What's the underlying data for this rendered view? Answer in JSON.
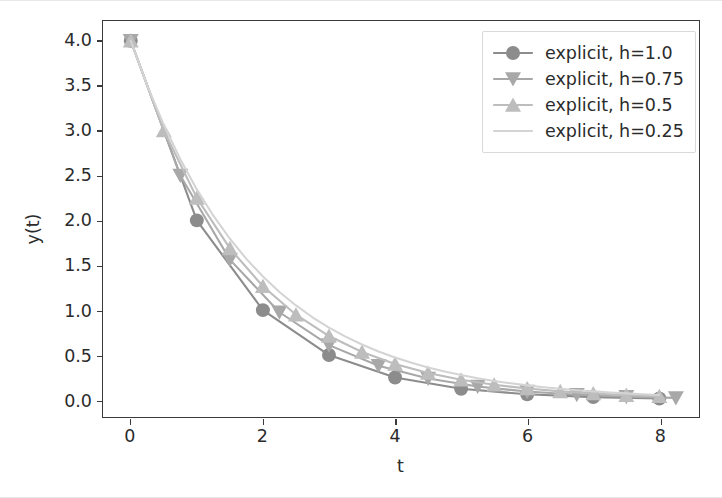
{
  "chart_data": {
    "type": "line",
    "title": "",
    "xlabel": "t",
    "ylabel": "y(t)",
    "xlim": [
      -0.42,
      8.6
    ],
    "ylim": [
      -0.19,
      4.22
    ],
    "xticks": [
      "0",
      "2",
      "4",
      "6",
      "8"
    ],
    "xtick_values": [
      0,
      2,
      4,
      6,
      8
    ],
    "yticks": [
      "0.0",
      "0.5",
      "1.0",
      "1.5",
      "2.0",
      "2.5",
      "3.0",
      "3.5",
      "4.0"
    ],
    "ytick_values": [
      0.0,
      0.5,
      1.0,
      1.5,
      2.0,
      2.5,
      3.0,
      3.5,
      4.0
    ],
    "grid": false,
    "legend_position": "upper right",
    "series": [
      {
        "name": "explicit, h=1.0",
        "color": "#8c8c8c",
        "marker": "circle",
        "marker_size": 7,
        "x": [
          0,
          1,
          2,
          3,
          4,
          5,
          6,
          7,
          8
        ],
        "y": [
          4.0,
          2.0,
          1.0,
          0.5,
          0.25,
          0.125,
          0.0625,
          0.03125,
          0.015625
        ]
      },
      {
        "name": "explicit, h=0.75",
        "color": "#a8a8a8",
        "marker": "triangle-down",
        "marker_size": 8,
        "x": [
          0,
          0.75,
          1.5,
          2.25,
          3.0,
          3.75,
          4.5,
          5.25,
          6.0,
          6.75,
          7.5,
          8.25
        ],
        "y": [
          4.0,
          2.5,
          1.5625,
          0.9766,
          0.6104,
          0.3815,
          0.2384,
          0.149,
          0.0931,
          0.0582,
          0.0364,
          0.0227
        ]
      },
      {
        "name": "explicit, h=0.5",
        "color": "#bdbdbd",
        "marker": "triangle-up",
        "marker_size": 8,
        "x": [
          0,
          0.5,
          1.0,
          1.5,
          2.0,
          2.5,
          3.0,
          3.5,
          4.0,
          4.5,
          5.0,
          5.5,
          6.0,
          6.5,
          7.0,
          7.5,
          8.0
        ],
        "y": [
          4.0,
          3.0,
          2.25,
          1.6875,
          1.2656,
          0.9492,
          0.7119,
          0.5339,
          0.4005,
          0.3003,
          0.2253,
          0.1689,
          0.1267,
          0.095,
          0.0713,
          0.0535,
          0.0401
        ]
      },
      {
        "name": "explicit, h=0.25",
        "color": "#d4d4d4",
        "marker": "none",
        "marker_size": 0,
        "x": [
          0,
          0.25,
          0.5,
          0.75,
          1.0,
          1.25,
          1.5,
          1.75,
          2.0,
          2.25,
          2.5,
          2.75,
          3.0,
          3.25,
          3.5,
          3.75,
          4.0,
          4.25,
          4.5,
          4.75,
          5.0,
          5.25,
          5.5,
          5.75,
          6.0,
          6.25,
          6.5,
          6.75,
          7.0,
          7.25,
          7.5,
          7.75,
          8.0
        ],
        "y": [
          4.0,
          3.5,
          3.0625,
          2.6797,
          2.3447,
          2.0516,
          1.7951,
          1.5707,
          1.3744,
          1.2026,
          1.0523,
          0.9207,
          0.8056,
          0.7049,
          0.6168,
          0.5397,
          0.4722,
          0.4132,
          0.3615,
          0.3163,
          0.2768,
          0.2422,
          0.2119,
          0.1854,
          0.1622,
          0.1419,
          0.1242,
          0.1087,
          0.0951,
          0.0832,
          0.0728,
          0.0637,
          0.0557
        ]
      }
    ]
  },
  "figure": {
    "background_color": "#ffffff",
    "axes_edge_color": "#3a3a3a",
    "tick_label_color": "#2b2b2b"
  }
}
